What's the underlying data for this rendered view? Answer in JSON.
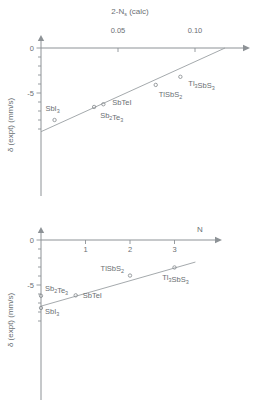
{
  "figure": {
    "marker_color": "#83888c",
    "line_color": "#9a9fa3",
    "axis_color": "#8d9296",
    "text_color": "#6a6f73"
  },
  "chart_data": [
    {
      "type": "scatter",
      "panel": "top",
      "title": "",
      "xlabel_main": "2-N",
      "xlabel_sub": "s",
      "xlabel_tail": " (calc)",
      "xlabel_full": "2-Ns (calc)",
      "ylabel_main": "δ (expt) (mm/s)",
      "xlabel_position": "top",
      "xlim": [
        0.0,
        0.12
      ],
      "ylim": [
        -9.5,
        0.5
      ],
      "xticks": [
        0.05,
        0.1
      ],
      "xtick_labels": [
        "0.05",
        "0.10"
      ],
      "yticks": [
        0,
        -5
      ],
      "ytick_labels": [
        "0",
        "-5"
      ],
      "yminor_step": 1,
      "grid": false,
      "legend": "none",
      "points": [
        {
          "label": "SbI3",
          "base": "SbI",
          "sub": "3",
          "x": 0.0088,
          "y": -8.0,
          "label_dx": -2,
          "label_dy": -9,
          "label_anchor": "middle"
        },
        {
          "label": "Sb2Te3",
          "base": "Sb",
          "sub": "2",
          "base2": "Te",
          "sub2": "3",
          "x": 0.0345,
          "y": -6.55,
          "label_dx": 6,
          "label_dy": 11,
          "label_anchor": "start"
        },
        {
          "label": "SbTeI",
          "base": "SbTeI",
          "sub": "",
          "x": 0.0405,
          "y": -6.25,
          "label_dx": 9,
          "label_dy": 1,
          "label_anchor": "start"
        },
        {
          "label": "TlSbS2",
          "base": "TlSbS",
          "sub": "2",
          "x": 0.0745,
          "y": -4.1,
          "label_dx": 3,
          "label_dy": 12,
          "label_anchor": "start"
        },
        {
          "label": "Tl3SbS3",
          "base": "Tl",
          "sub": "3",
          "base2": "SbS",
          "sub2": "3",
          "x": 0.0905,
          "y": -3.2,
          "label_dx": 8,
          "label_dy": 9,
          "label_anchor": "start"
        }
      ],
      "trend_line": {
        "x1": 0.0,
        "y1": -9.3,
        "x2": 0.1195,
        "y2": 0.0
      }
    },
    {
      "type": "scatter",
      "panel": "bottom",
      "title": "",
      "xlabel_main": "N",
      "xlabel_full": "N",
      "ylabel_main": "δ (expt) (mm/s)",
      "xlabel_position": "top-right",
      "xlim": [
        0.0,
        4.0
      ],
      "ylim": [
        -9.5,
        0.5
      ],
      "xticks": [
        1,
        2,
        3
      ],
      "xtick_labels": [
        "1",
        "2",
        "3"
      ],
      "yticks": [
        0,
        -5
      ],
      "ytick_labels": [
        "0",
        "-5"
      ],
      "yminor_step": 1,
      "grid": false,
      "legend": "none",
      "points": [
        {
          "label": "SbI3",
          "base": "SbI",
          "sub": "3",
          "x": 0.0,
          "y": -7.55,
          "label_dx": 4,
          "label_dy": 6,
          "label_anchor": "start"
        },
        {
          "label": "Sb2Te3",
          "base": "Sb",
          "sub": "2",
          "base2": "Te",
          "sub2": "3",
          "x": 0.0,
          "y": -6.2,
          "label_dx": 4,
          "label_dy": -5,
          "label_anchor": "start"
        },
        {
          "label": "SbTeI",
          "base": "SbTeI",
          "sub": "",
          "x": 0.78,
          "y": -6.15,
          "label_dx": 7,
          "label_dy": 3,
          "label_anchor": "start"
        },
        {
          "label": "TlSbS2",
          "base": "TlSbS",
          "sub": "2",
          "x": 2.0,
          "y": -3.95,
          "label_dx": -6,
          "label_dy": -5,
          "label_anchor": "end"
        },
        {
          "label": "Tl3SbS3",
          "base": "Tl",
          "sub": "3",
          "base2": "SbS",
          "sub2": "3",
          "x": 3.0,
          "y": -3.05,
          "label_dx": 1,
          "label_dy": 13,
          "label_anchor": "middle"
        }
      ],
      "trend_line": {
        "x1": 0.0,
        "y1": -7.35,
        "x2": 3.47,
        "y2": -2.45
      }
    }
  ]
}
